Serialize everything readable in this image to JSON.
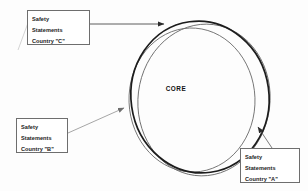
{
  "diagram": {
    "background_color": "#fdfdfd",
    "core_label": "CORE",
    "boxes": [
      {
        "id": "country-c",
        "line1": "Safety",
        "line2": "Statements",
        "line3": "Country \"C\"",
        "border_color": "#6e6e6e",
        "fill_color": "#ffffff"
      },
      {
        "id": "country-b",
        "line1": "Safety",
        "line2": "Statements",
        "line3": "Country \"B\"",
        "border_color": "#6e6e6e",
        "fill_color": "#ffffff"
      },
      {
        "id": "country-a",
        "line1": "Safety",
        "line2": "Statements",
        "line3": "Country \"A\"",
        "border_color": "#6e6e6e",
        "fill_color": "#ffffff"
      }
    ],
    "ellipses": [
      {
        "id": "ellipse-country-c",
        "stroke_color": "#1c1c1c",
        "stroke_width": 1.6,
        "cx": 200,
        "cy": 97,
        "rx": 69,
        "ry": 76,
        "rotate": -8
      },
      {
        "id": "ellipse-country-a",
        "stroke_color": "#6a6a6a",
        "stroke_width": 0.9,
        "cx": 204,
        "cy": 100,
        "rx": 66,
        "ry": 76,
        "rotate": 7
      },
      {
        "id": "ellipse-country-b",
        "stroke_color": "#6a6a6a",
        "stroke_width": 0.9,
        "cx": 192,
        "cy": 100,
        "rx": 63,
        "ry": 72,
        "rotate": -2
      }
    ],
    "leaders": [
      {
        "id": "leader-country-c",
        "from_x": 90,
        "from_y": 24,
        "to_x": 166,
        "to_y": 24,
        "stroke_color": "#4a4a4a"
      },
      {
        "id": "leader-country-b",
        "from_x": 68,
        "from_y": 133,
        "to_x": 126,
        "to_y": 107,
        "stroke_color": "#8a8a8a"
      },
      {
        "id": "leader-country-a",
        "from_x": 272,
        "from_y": 148,
        "to_x": 257,
        "to_y": 126,
        "stroke_color": "#5a5a5a"
      }
    ],
    "stray_mark": {
      "id": "stray-tick",
      "x1": 18,
      "y1": 50,
      "x2": 32,
      "y2": 12,
      "stroke_color": "#bdbdbd"
    }
  }
}
